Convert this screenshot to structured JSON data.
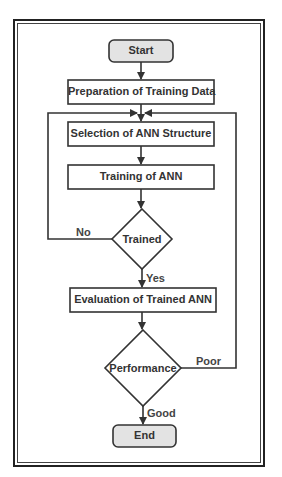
{
  "diagram": {
    "type": "flowchart",
    "nodes": {
      "start": "Start",
      "prep": "Preparation of Training Data",
      "selection": "Selection of ANN Structure",
      "training": "Training of ANN",
      "trained": "Trained",
      "evaluation": "Evaluation of Trained ANN",
      "performance": "Performance",
      "end": "End"
    },
    "edges": {
      "no": "No",
      "yes": "Yes",
      "poor": "Poor",
      "good": "Good"
    },
    "colors": {
      "stroke": "#333333",
      "terminal_fill": "#e3e3e3",
      "box_fill": "#ffffff"
    }
  }
}
